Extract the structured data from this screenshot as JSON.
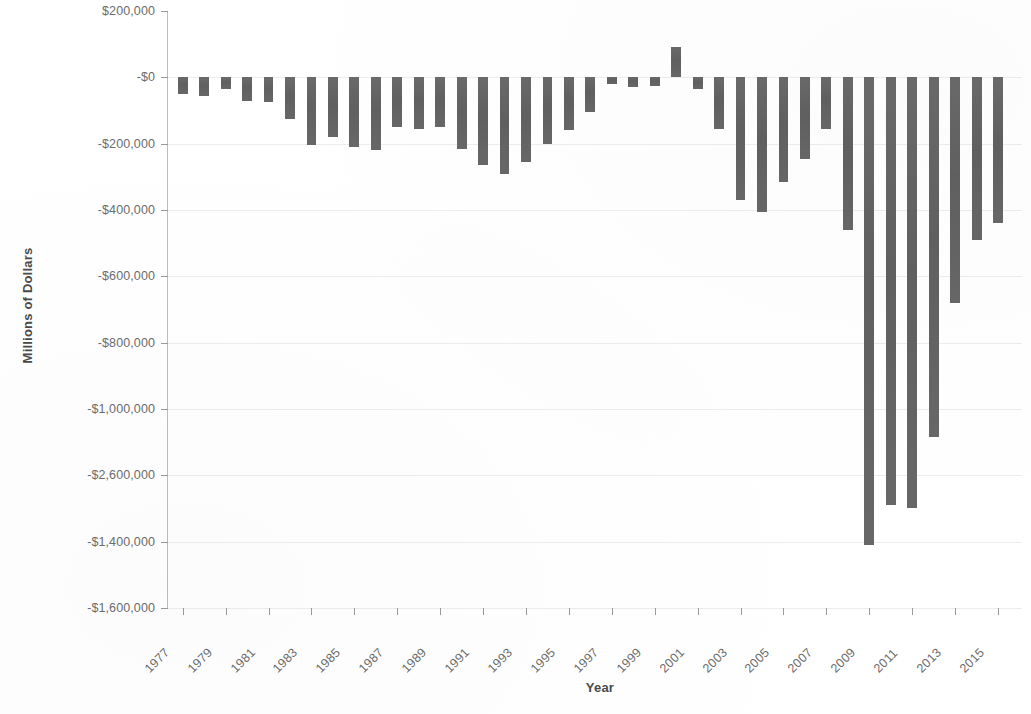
{
  "chart_data": {
    "type": "bar",
    "title": "",
    "xlabel": "Year",
    "ylabel": "Millions of Dollars",
    "grid": true,
    "legend": false,
    "bar_color": "#646464",
    "axis_color": "#9a9a9a",
    "gridline_color": "#ededed",
    "label_color": "#6c6c6c",
    "xlim": [
      1976.5,
      2015.5
    ],
    "x_tick_step": 2,
    "x_tick_labels": [
      "1977",
      "1979",
      "1981",
      "1983",
      "1985",
      "1987",
      "1989",
      "1991",
      "1993",
      "1995",
      "1997",
      "1999",
      "2001",
      "2003",
      "2005",
      "2007",
      "2009",
      "2011",
      "2013",
      "2015"
    ],
    "y_tick_labels": [
      "$200,000",
      "-$0",
      "-$200,000",
      "-$400,000",
      "-$600,000",
      "-$800,000",
      "-$1,000,000",
      "-$2,600,000",
      "-$1,400,000",
      "-$1,600,000"
    ],
    "y_tick_values": [
      200000,
      0,
      -200000,
      -400000,
      -600000,
      -800000,
      -1000000,
      -1200000,
      -1400000,
      -1600000
    ],
    "y_axis_note": "Axis label at the -1,200,000 position is mislabeled '-$2,600,000' in the source figure.",
    "ylim": [
      -1600000,
      200000
    ],
    "categories": [
      1977,
      1978,
      1979,
      1980,
      1981,
      1982,
      1983,
      1984,
      1985,
      1986,
      1987,
      1988,
      1989,
      1990,
      1991,
      1992,
      1993,
      1994,
      1995,
      1996,
      1997,
      1998,
      1999,
      2000,
      2001,
      2002,
      2003,
      2004,
      2005,
      2006,
      2007,
      2008,
      2009,
      2010,
      2011,
      2012,
      2013,
      2014,
      2015
    ],
    "values": [
      -53000,
      -59000,
      -40000,
      -74000,
      -79000,
      -128000,
      -208000,
      -185000,
      -212000,
      -221000,
      -150000,
      -155000,
      -153000,
      -221000,
      -269000,
      -290000,
      -255000,
      -203000,
      -164000,
      -107000,
      -22000,
      69000,
      126000,
      236000,
      128000,
      -158000,
      -378000,
      -413000,
      -318000,
      -248000,
      -161000,
      -459000,
      -1413000,
      -1294000,
      -1300000,
      -1087000,
      -680000,
      -485000,
      -439000
    ],
    "bar_pixel_values": [
      -50000,
      -55000,
      -35000,
      -70000,
      -75000,
      -125000,
      -205000,
      -180000,
      -210000,
      -220000,
      -150000,
      -155000,
      -150000,
      -215000,
      -265000,
      -290000,
      -255000,
      -200000,
      -160000,
      -105000,
      -20000,
      -30000,
      -25000,
      90000,
      -35000,
      -155000,
      -370000,
      -405000,
      -315000,
      -245000,
      -155000,
      -460000,
      -1410000,
      -1290000,
      -1300000,
      -1085000,
      -680000,
      -490000,
      -440000
    ],
    "source_note": "Annual values, millions of dollars"
  },
  "axes": {
    "y_title": "Millions of Dollars",
    "x_title": "Year"
  }
}
